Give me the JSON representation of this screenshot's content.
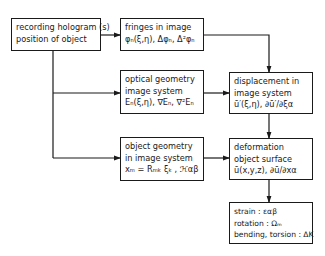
{
  "diagram": {
    "nodes": [
      {
        "id": "recording",
        "lines": [
          "recording hologram (s)",
          "position of object"
        ]
      },
      {
        "id": "fringes",
        "lines": [
          "fringes in image",
          "φₙ(ξ,η), Δφₙ, Δ²φₙ"
        ]
      },
      {
        "id": "optical",
        "lines": [
          "optical geometry",
          "image system",
          "Eₙ(ξ,η), ∇Eₙ, ∇²Eₙ"
        ]
      },
      {
        "id": "displacement_image",
        "lines": [
          "displacement in",
          "image system",
          "ū′(ξ,η), ∂ū′/∂ξα"
        ]
      },
      {
        "id": "object_geometry",
        "lines": [
          "object geometry",
          "in image system",
          "xₘ = Rₘₖ ξₖ , ℋαβ"
        ]
      },
      {
        "id": "deformation",
        "lines": [
          "deformation",
          "object surface",
          "ū(x,y,z), ∂ū/∂xα"
        ]
      },
      {
        "id": "results",
        "lines": [
          "strain : εαβ",
          "rotation : Ωₘ",
          "bending, torsion : ΔK"
        ]
      }
    ],
    "edges": [
      {
        "from": "recording",
        "to": "fringes"
      },
      {
        "from": "recording",
        "to": "optical"
      },
      {
        "from": "recording",
        "to": "object_geometry"
      },
      {
        "from": "fringes",
        "to": "displacement_image"
      },
      {
        "from": "optical",
        "to": "displacement_image"
      },
      {
        "from": "displacement_image",
        "to": "deformation"
      },
      {
        "from": "object_geometry",
        "to": "deformation"
      },
      {
        "from": "deformation",
        "to": "results"
      }
    ]
  }
}
